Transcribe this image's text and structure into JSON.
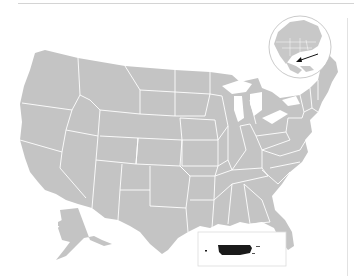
{
  "map": {
    "title": "Location map of Puerto Rico relative to the United States",
    "subject": "Puerto Rico",
    "region": "United States",
    "colors": {
      "land": "#c4c4c4",
      "borders": "#ffffff",
      "highlight": "#1a1a1a",
      "globe_outline": "#bdbdbd",
      "arrow": "#111111",
      "inset_border": "#dcdcdc",
      "background": "#ffffff"
    },
    "insets": [
      {
        "name": "Alaska",
        "position": "bottom-left"
      },
      {
        "name": "Puerto Rico",
        "position": "bottom-center",
        "highlighted": true
      }
    ],
    "locator_globe": {
      "depicts": "North America",
      "arrow_points_to": "Caribbean"
    }
  }
}
